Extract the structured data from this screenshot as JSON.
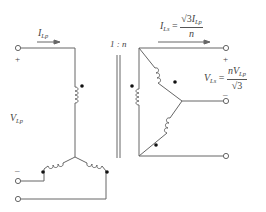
{
  "diagram": {
    "type": "Y-delta transformer connection",
    "primary": {
      "current_label": {
        "sym": "I",
        "sub": "Lp"
      },
      "voltage_label": {
        "sym": "V",
        "sub": "Lp"
      },
      "plus": "+",
      "minus": "–"
    },
    "ratio_label": "1 : n",
    "secondary": {
      "current_label": {
        "sym": "I",
        "sub": "Ls",
        "eq": "=",
        "num_root": "√3",
        "num_sym": "I",
        "num_sub": "Lp",
        "den": "n"
      },
      "voltage_label": {
        "sym": "V",
        "sub": "Ls",
        "eq": "=",
        "num_pre": "n",
        "num_sym": "V",
        "num_sub": "Lp",
        "den_root": "√3"
      },
      "plus": "+",
      "minus": "–"
    },
    "colors": {
      "wire": "#666666",
      "dot": "#111111",
      "text": "#444444"
    }
  }
}
